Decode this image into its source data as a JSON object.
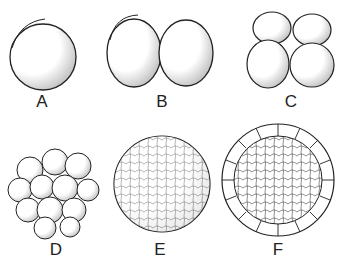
{
  "figure": {
    "panels": [
      {
        "label": "A",
        "stage": "zygote (1 cell)"
      },
      {
        "label": "B",
        "stage": "2-cell stage"
      },
      {
        "label": "C",
        "stage": "4-cell stage"
      },
      {
        "label": "D",
        "stage": "morula"
      },
      {
        "label": "E",
        "stage": "late morula / early blastula"
      },
      {
        "label": "F",
        "stage": "blastula (cross section)"
      }
    ],
    "colors": {
      "stroke": "#222222",
      "fill": "#ffffff",
      "shade": "#bbbbbb"
    }
  }
}
